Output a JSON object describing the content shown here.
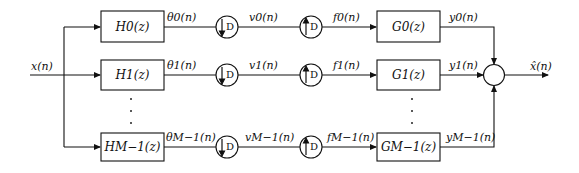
{
  "diagram": {
    "type": "block-diagram",
    "input_label": "x(n)",
    "output_label": "x̂(n)",
    "decimation_factor": "D",
    "channels": [
      {
        "analysis_filter": "H0(z)",
        "analysis_output": "θ0(n)",
        "downsampler": "↓D",
        "down_output": "v0(n)",
        "upsampler": "↑D",
        "up_output": "f0(n)",
        "synthesis_filter": "G0(z)",
        "synthesis_output": "y0(n)"
      },
      {
        "analysis_filter": "H1(z)",
        "analysis_output": "θ1(n)",
        "downsampler": "↓D",
        "down_output": "v1(n)",
        "upsampler": "↑D",
        "up_output": "f1(n)",
        "synthesis_filter": "G1(z)",
        "synthesis_output": "y1(n)"
      },
      {
        "analysis_filter": "HM−1(z)",
        "analysis_output": "θM−1(n)",
        "downsampler": "↓D",
        "down_output": "vM−1(n)",
        "upsampler": "↑D",
        "up_output": "fM−1(n)",
        "synthesis_filter": "GM−1(z)",
        "synthesis_output": "yM−1(n)"
      }
    ],
    "summation_node": "+",
    "colors": {
      "stroke": "#111111",
      "background": "#ffffff"
    }
  }
}
